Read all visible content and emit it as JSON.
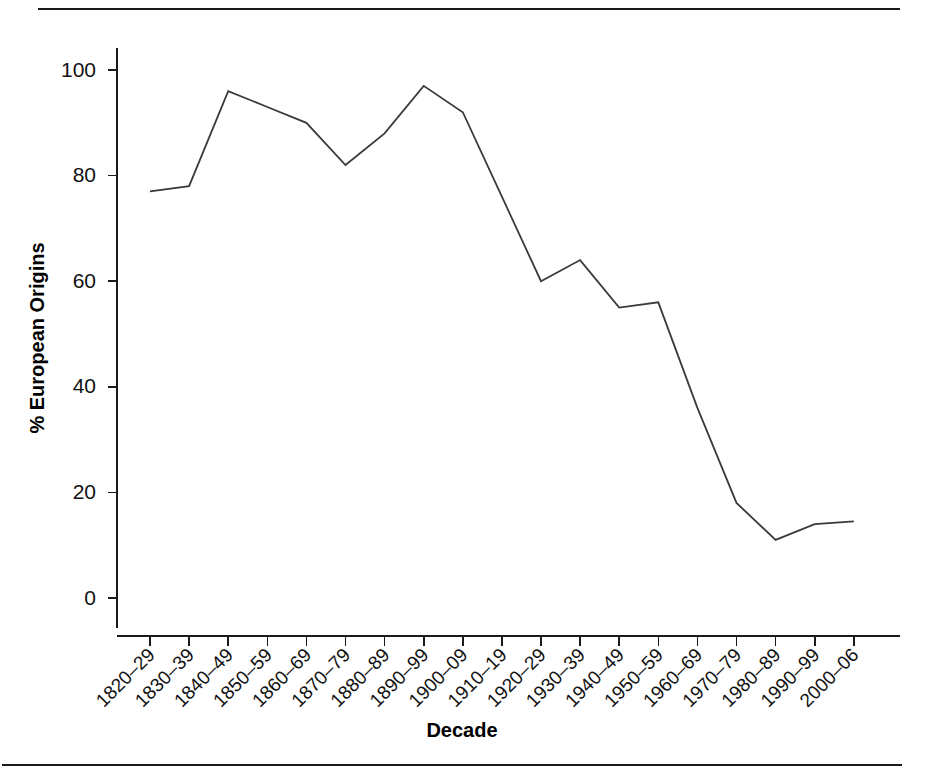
{
  "figure": {
    "top_rule": "horizontal-rule",
    "bottom_rule": "horizontal-rule"
  },
  "chart_data": {
    "type": "line",
    "title": "",
    "subtitle": "",
    "xlabel": "Decade",
    "ylabel": "% European Origins",
    "categories": [
      "1820–29",
      "1830–39",
      "1840–49",
      "1850–59",
      "1860–69",
      "1870–79",
      "1880–89",
      "1890–99",
      "1900–09",
      "1910–19",
      "1920–29",
      "1930–39",
      "1940–49",
      "1950–59",
      "1960–69",
      "1970–79",
      "1980–89",
      "1990–99",
      "2000–06"
    ],
    "values": [
      77,
      78,
      96,
      93,
      90,
      82,
      88,
      97,
      92,
      76,
      60,
      64,
      55,
      56,
      36,
      18,
      11,
      14,
      14.5
    ],
    "ylim": [
      0,
      105
    ],
    "yticks": [
      0,
      20,
      40,
      60,
      80,
      100
    ],
    "ytick_labels": [
      "0",
      "20",
      "40",
      "60",
      "80",
      "100"
    ],
    "grid": false,
    "legend": null,
    "legend_position": "none",
    "line_color": "#3a3a3a",
    "axis_color": "#1a1a1a"
  }
}
